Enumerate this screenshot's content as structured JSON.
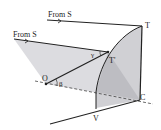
{
  "diagram": {
    "labels": {
      "ray_top": "From S",
      "ray_mid": "From S",
      "point_T": "T",
      "point_T_prime": "T'",
      "point_O": "O",
      "point_C": "C",
      "point_V": "V",
      "angle_gamma": "γ",
      "angle_beta": "β"
    },
    "colors": {
      "line": "#222222",
      "shade_light": "#d8d8dc",
      "shade_mid": "#c4c4c8",
      "shade_dark": "#b0b0b4"
    }
  }
}
